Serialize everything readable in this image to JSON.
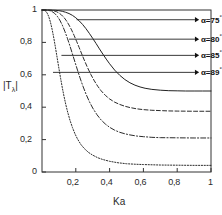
{
  "chart_data": {
    "type": "line",
    "title": "",
    "xlabel": "Ka",
    "ylabel": "|Tλ|",
    "xlim": [
      0,
      1
    ],
    "ylim": [
      0,
      1
    ],
    "grid": false,
    "legend_position": "inside-upper-right",
    "xticks": [
      {
        "value": 0.2,
        "label": "0,2"
      },
      {
        "value": 0.4,
        "label": "0,4"
      },
      {
        "value": 0.6,
        "label": "0,6"
      },
      {
        "value": 0.8,
        "label": "0,8"
      },
      {
        "value": 1.0,
        "label": "1"
      }
    ],
    "yticks": [
      {
        "value": 0,
        "label": "0"
      },
      {
        "value": 0.2,
        "label": "0,2"
      },
      {
        "value": 0.4,
        "label": "0,4"
      },
      {
        "value": 0.6,
        "label": "0,6"
      },
      {
        "value": 0.8,
        "label": "0,8"
      },
      {
        "value": 1.0,
        "label": "1"
      }
    ],
    "series": [
      {
        "name": "alpha-75",
        "label": "α=75",
        "angle": "75",
        "degree_symbol": "°",
        "style": "solid",
        "color": "#222222",
        "plateau": 0.5,
        "points": [
          [
            0.0,
            1.0
          ],
          [
            0.02,
            1.0
          ],
          [
            0.04,
            1.0
          ],
          [
            0.06,
            0.999
          ],
          [
            0.08,
            0.998
          ],
          [
            0.1,
            0.996
          ],
          [
            0.12,
            0.992
          ],
          [
            0.14,
            0.986
          ],
          [
            0.16,
            0.978
          ],
          [
            0.18,
            0.967
          ],
          [
            0.2,
            0.952
          ],
          [
            0.22,
            0.933
          ],
          [
            0.24,
            0.911
          ],
          [
            0.26,
            0.885
          ],
          [
            0.28,
            0.856
          ],
          [
            0.3,
            0.825
          ],
          [
            0.32,
            0.793
          ],
          [
            0.34,
            0.76
          ],
          [
            0.36,
            0.728
          ],
          [
            0.38,
            0.697
          ],
          [
            0.4,
            0.668
          ],
          [
            0.43,
            0.629
          ],
          [
            0.46,
            0.597
          ],
          [
            0.49,
            0.571
          ],
          [
            0.52,
            0.551
          ],
          [
            0.55,
            0.536
          ],
          [
            0.58,
            0.525
          ],
          [
            0.61,
            0.517
          ],
          [
            0.65,
            0.51
          ],
          [
            0.7,
            0.505
          ],
          [
            0.75,
            0.502
          ],
          [
            0.8,
            0.501
          ],
          [
            0.85,
            0.5
          ],
          [
            0.9,
            0.5
          ],
          [
            0.95,
            0.5
          ],
          [
            1.0,
            0.5
          ]
        ]
      },
      {
        "name": "alpha-80",
        "label": "α=80",
        "angle": "80",
        "degree_symbol": "°",
        "style": "dashed",
        "color": "#2b2b2b",
        "plateau": 0.375,
        "points": [
          [
            0.0,
            1.0
          ],
          [
            0.02,
            1.0
          ],
          [
            0.04,
            0.999
          ],
          [
            0.055,
            0.998
          ],
          [
            0.07,
            0.995
          ],
          [
            0.085,
            0.99
          ],
          [
            0.1,
            0.982
          ],
          [
            0.115,
            0.97
          ],
          [
            0.13,
            0.954
          ],
          [
            0.145,
            0.933
          ],
          [
            0.16,
            0.907
          ],
          [
            0.175,
            0.877
          ],
          [
            0.19,
            0.843
          ],
          [
            0.205,
            0.806
          ],
          [
            0.22,
            0.768
          ],
          [
            0.235,
            0.729
          ],
          [
            0.25,
            0.691
          ],
          [
            0.27,
            0.643
          ],
          [
            0.29,
            0.6
          ],
          [
            0.31,
            0.562
          ],
          [
            0.33,
            0.529
          ],
          [
            0.35,
            0.501
          ],
          [
            0.375,
            0.473
          ],
          [
            0.4,
            0.451
          ],
          [
            0.43,
            0.431
          ],
          [
            0.46,
            0.417
          ],
          [
            0.49,
            0.406
          ],
          [
            0.52,
            0.398
          ],
          [
            0.56,
            0.39
          ],
          [
            0.6,
            0.385
          ],
          [
            0.65,
            0.381
          ],
          [
            0.7,
            0.379
          ],
          [
            0.75,
            0.377
          ],
          [
            0.8,
            0.376
          ],
          [
            0.9,
            0.375
          ],
          [
            1.0,
            0.375
          ]
        ]
      },
      {
        "name": "alpha-85",
        "label": "α=85",
        "angle": "85",
        "degree_symbol": "°",
        "style": "dash-dot",
        "color": "#2b2b2b",
        "plateau": 0.21,
        "points": [
          [
            0.0,
            1.0
          ],
          [
            0.015,
            1.0
          ],
          [
            0.03,
            0.999
          ],
          [
            0.045,
            0.996
          ],
          [
            0.06,
            0.99
          ],
          [
            0.075,
            0.979
          ],
          [
            0.09,
            0.962
          ],
          [
            0.105,
            0.938
          ],
          [
            0.12,
            0.907
          ],
          [
            0.135,
            0.869
          ],
          [
            0.15,
            0.826
          ],
          [
            0.165,
            0.779
          ],
          [
            0.18,
            0.729
          ],
          [
            0.195,
            0.679
          ],
          [
            0.21,
            0.629
          ],
          [
            0.225,
            0.581
          ],
          [
            0.24,
            0.536
          ],
          [
            0.26,
            0.482
          ],
          [
            0.28,
            0.435
          ],
          [
            0.3,
            0.395
          ],
          [
            0.325,
            0.354
          ],
          [
            0.35,
            0.321
          ],
          [
            0.375,
            0.296
          ],
          [
            0.4,
            0.276
          ],
          [
            0.43,
            0.258
          ],
          [
            0.46,
            0.245
          ],
          [
            0.49,
            0.236
          ],
          [
            0.52,
            0.229
          ],
          [
            0.56,
            0.222
          ],
          [
            0.6,
            0.218
          ],
          [
            0.65,
            0.214
          ],
          [
            0.7,
            0.212
          ],
          [
            0.8,
            0.211
          ],
          [
            0.9,
            0.21
          ],
          [
            1.0,
            0.21
          ]
        ]
      },
      {
        "name": "alpha-89",
        "label": "α=89",
        "angle": "89",
        "degree_symbol": "°",
        "style": "dotted",
        "color": "#2b2b2b",
        "plateau": 0.04,
        "points": [
          [
            0.0,
            1.0
          ],
          [
            0.01,
            0.999
          ],
          [
            0.02,
            0.994
          ],
          [
            0.03,
            0.982
          ],
          [
            0.04,
            0.959
          ],
          [
            0.05,
            0.925
          ],
          [
            0.06,
            0.88
          ],
          [
            0.07,
            0.826
          ],
          [
            0.08,
            0.766
          ],
          [
            0.09,
            0.703
          ],
          [
            0.1,
            0.64
          ],
          [
            0.11,
            0.579
          ],
          [
            0.12,
            0.521
          ],
          [
            0.13,
            0.468
          ],
          [
            0.14,
            0.42
          ],
          [
            0.15,
            0.377
          ],
          [
            0.165,
            0.321
          ],
          [
            0.18,
            0.275
          ],
          [
            0.195,
            0.236
          ],
          [
            0.21,
            0.204
          ],
          [
            0.23,
            0.17
          ],
          [
            0.25,
            0.145
          ],
          [
            0.275,
            0.121
          ],
          [
            0.3,
            0.104
          ],
          [
            0.33,
            0.088
          ],
          [
            0.36,
            0.077
          ],
          [
            0.4,
            0.066
          ],
          [
            0.45,
            0.057
          ],
          [
            0.5,
            0.051
          ],
          [
            0.55,
            0.048
          ],
          [
            0.6,
            0.046
          ],
          [
            0.7,
            0.043
          ],
          [
            0.8,
            0.042
          ],
          [
            0.9,
            0.041
          ],
          [
            1.0,
            0.041
          ]
        ]
      }
    ],
    "annotations": [
      {
        "name": "leader-75",
        "series": "alpha-75",
        "from_x": 0.205,
        "from_y": 0.94,
        "to_x": 0.905,
        "to_y": 0.94
      },
      {
        "name": "leader-80",
        "series": "alpha-80",
        "from_x": 0.16,
        "from_y": 0.82,
        "to_x": 0.905,
        "to_y": 0.82
      },
      {
        "name": "leader-85",
        "series": "alpha-85",
        "from_x": 0.115,
        "from_y": 0.72,
        "to_x": 0.905,
        "to_y": 0.72
      },
      {
        "name": "leader-89",
        "series": "alpha-89",
        "from_x": 0.065,
        "from_y": 0.615,
        "to_x": 0.905,
        "to_y": 0.615
      }
    ]
  }
}
